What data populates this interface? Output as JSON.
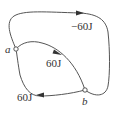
{
  "diagram": {
    "type": "thermodynamic-process-paths",
    "points": [
      {
        "id": "a",
        "label": "a"
      },
      {
        "id": "b",
        "label": "b"
      }
    ],
    "paths": [
      {
        "id": "outer",
        "from": "a",
        "to": "b",
        "direction": "clockwise over top",
        "label": "−60J"
      },
      {
        "id": "upper-inner",
        "from": "a",
        "to": "b",
        "label": "60J"
      },
      {
        "id": "lower-inner",
        "from": "b",
        "to": "a",
        "label": "60J"
      }
    ],
    "colors": {
      "stroke": "#555555",
      "text": "#333333",
      "background": "#ffffff"
    }
  }
}
